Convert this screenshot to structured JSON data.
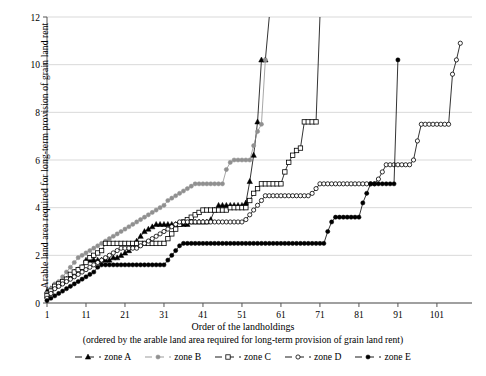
{
  "axes": {
    "ylabel": "Arable land area required for long-term provision of grain land rent",
    "xlabel_line1": "Order of the landholdings",
    "xlabel_line2": "(ordered by the arable land area required for long-term provision of grain land rent)",
    "yticks": [
      "0",
      "2",
      "4",
      "6",
      "8",
      "10",
      "12"
    ],
    "xticks": [
      "1",
      "11",
      "21",
      "31",
      "41",
      "51",
      "61",
      "71",
      "81",
      "91",
      "101"
    ]
  },
  "legend": {
    "items": [
      {
        "label": "zone A",
        "marker": "filled-triangle",
        "color": "#000000"
      },
      {
        "label": "zone B",
        "marker": "filled-circle",
        "color": "#909090"
      },
      {
        "label": "zone C",
        "marker": "open-square",
        "color": "#000000"
      },
      {
        "label": "zone D",
        "marker": "open-circle",
        "color": "#000000"
      },
      {
        "label": "zone E",
        "marker": "filled-circle",
        "color": "#000000"
      }
    ]
  },
  "chart_data": {
    "type": "line",
    "title": "",
    "xlabel": "Order of the landholdings (ordered by the arable land area required for long-term provision of grain land rent)",
    "ylabel": "Arable land area required for long-term provision of grain land rent",
    "xlim": [
      1,
      110
    ],
    "ylim": [
      0,
      12
    ],
    "xticks": [
      1,
      11,
      21,
      31,
      41,
      51,
      61,
      71,
      81,
      91,
      101
    ],
    "yticks": [
      0,
      2,
      4,
      6,
      8,
      10,
      12
    ],
    "grid": "horizontal",
    "legend_position": "bottom",
    "note": "Step (staircase) curves; each series terminates with a vertical rise off the top of the plot.",
    "series": [
      {
        "name": "zone A",
        "marker": "filled-triangle",
        "color": "#000000",
        "x": [
          1,
          2,
          3,
          4,
          5,
          6,
          7,
          8,
          9,
          10,
          11,
          12,
          13,
          14,
          15,
          16,
          17,
          18,
          19,
          20,
          21,
          22,
          23,
          24,
          25,
          26,
          27,
          28,
          29,
          30,
          31,
          32,
          33,
          34,
          35,
          36,
          37,
          38,
          39,
          40,
          41,
          42,
          43,
          44,
          45,
          46,
          47,
          48,
          49,
          50,
          51,
          52,
          53,
          54,
          55,
          56,
          57,
          58
        ],
        "y": [
          0.5,
          0.6,
          0.7,
          0.8,
          0.9,
          1.0,
          1.1,
          1.3,
          1.4,
          1.5,
          1.8,
          1.8,
          1.8,
          1.8,
          1.8,
          1.8,
          1.8,
          1.9,
          1.9,
          2.0,
          2.1,
          2.2,
          2.4,
          2.6,
          2.8,
          3.0,
          3.1,
          3.2,
          3.3,
          3.3,
          3.3,
          3.3,
          3.3,
          3.3,
          3.3,
          3.3,
          3.3,
          3.4,
          3.4,
          3.4,
          3.4,
          3.4,
          3.5,
          3.9,
          4.1,
          4.1,
          4.1,
          4.1,
          4.1,
          4.1,
          4.1,
          4.2,
          5.1,
          6.2,
          7.6,
          10.2,
          10.2,
          12.0
        ]
      },
      {
        "name": "zone B",
        "marker": "filled-circle",
        "color": "#909090",
        "x": [
          1,
          2,
          3,
          4,
          5,
          6,
          7,
          8,
          9,
          10,
          11,
          12,
          13,
          14,
          15,
          16,
          17,
          18,
          19,
          20,
          21,
          22,
          23,
          24,
          25,
          26,
          27,
          28,
          29,
          30,
          31,
          32,
          33,
          34,
          35,
          36,
          37,
          38,
          39,
          40,
          41,
          42,
          43,
          44,
          45,
          46,
          47,
          48,
          49,
          50,
          51,
          52,
          53,
          54,
          55,
          56,
          57
        ],
        "y": [
          0.4,
          0.6,
          0.8,
          0.9,
          1.1,
          1.3,
          1.5,
          1.7,
          1.9,
          2.0,
          2.1,
          2.2,
          2.3,
          2.4,
          2.5,
          2.6,
          2.7,
          2.8,
          2.9,
          3.0,
          3.1,
          3.2,
          3.3,
          3.4,
          3.5,
          3.6,
          3.7,
          3.8,
          3.9,
          4.0,
          4.1,
          4.3,
          4.4,
          4.5,
          4.6,
          4.7,
          4.8,
          4.9,
          5.0,
          5.0,
          5.0,
          5.0,
          5.0,
          5.0,
          5.0,
          5.0,
          5.6,
          5.9,
          6.0,
          6.0,
          6.0,
          6.0,
          6.0,
          6.6,
          7.2,
          7.5,
          10.2
        ]
      },
      {
        "name": "zone C",
        "marker": "open-square",
        "color": "#000000",
        "x": [
          1,
          2,
          3,
          4,
          5,
          6,
          7,
          8,
          9,
          10,
          11,
          12,
          13,
          14,
          15,
          16,
          17,
          18,
          19,
          20,
          21,
          22,
          23,
          24,
          25,
          26,
          27,
          28,
          29,
          30,
          31,
          32,
          33,
          34,
          35,
          36,
          37,
          38,
          39,
          40,
          41,
          42,
          43,
          44,
          45,
          46,
          47,
          48,
          49,
          50,
          51,
          52,
          53,
          54,
          55,
          56,
          57,
          58,
          59,
          60,
          61,
          62,
          63,
          64,
          65,
          66,
          67,
          68,
          69,
          70,
          71
        ],
        "y": [
          0.3,
          0.5,
          0.7,
          0.8,
          0.9,
          1.0,
          1.2,
          1.3,
          1.4,
          1.5,
          1.7,
          1.9,
          2.0,
          2.1,
          2.2,
          2.5,
          2.5,
          2.5,
          2.5,
          2.5,
          2.5,
          2.5,
          2.5,
          2.5,
          2.5,
          2.5,
          2.5,
          2.5,
          2.5,
          2.5,
          2.5,
          2.7,
          2.9,
          3.1,
          3.3,
          3.4,
          3.5,
          3.6,
          3.7,
          3.8,
          3.9,
          3.9,
          3.9,
          3.9,
          3.9,
          3.9,
          3.9,
          4.0,
          4.0,
          4.0,
          4.0,
          4.0,
          4.3,
          4.6,
          4.8,
          5.0,
          5.0,
          5.0,
          5.0,
          5.0,
          5.0,
          5.5,
          5.9,
          6.2,
          6.4,
          6.5,
          7.6,
          7.6,
          7.6,
          7.6,
          12.0
        ]
      },
      {
        "name": "zone D",
        "marker": "open-circle",
        "color": "#000000",
        "x": [
          1,
          2,
          3,
          4,
          5,
          6,
          7,
          8,
          9,
          10,
          11,
          12,
          13,
          14,
          15,
          16,
          17,
          18,
          19,
          20,
          21,
          22,
          23,
          24,
          25,
          26,
          27,
          28,
          29,
          30,
          31,
          32,
          33,
          34,
          35,
          36,
          37,
          38,
          39,
          40,
          41,
          42,
          43,
          44,
          45,
          46,
          47,
          48,
          49,
          50,
          51,
          52,
          53,
          54,
          55,
          56,
          57,
          58,
          59,
          60,
          61,
          62,
          63,
          64,
          65,
          66,
          67,
          68,
          69,
          70,
          71,
          72,
          73,
          74,
          75,
          76,
          77,
          78,
          79,
          80,
          81,
          82,
          83,
          84,
          85,
          86,
          87,
          88,
          89,
          90,
          91,
          92,
          93,
          94,
          95,
          96,
          97,
          98,
          99,
          100,
          101,
          102,
          103,
          104,
          105,
          106,
          107
        ],
        "y": [
          0.2,
          0.4,
          0.6,
          0.7,
          0.8,
          0.9,
          1.0,
          1.1,
          1.2,
          1.3,
          1.4,
          1.5,
          1.6,
          1.7,
          1.8,
          1.9,
          2.0,
          2.1,
          2.2,
          2.3,
          2.3,
          2.3,
          2.3,
          2.3,
          2.4,
          2.5,
          2.6,
          2.7,
          2.8,
          2.9,
          3.0,
          3.1,
          3.2,
          3.3,
          3.4,
          3.4,
          3.4,
          3.4,
          3.4,
          3.4,
          3.4,
          3.4,
          3.4,
          3.4,
          3.4,
          3.4,
          3.4,
          3.4,
          3.4,
          3.4,
          3.4,
          3.5,
          3.7,
          3.9,
          4.1,
          4.3,
          4.5,
          4.5,
          4.5,
          4.5,
          4.5,
          4.5,
          4.5,
          4.5,
          4.5,
          4.5,
          4.5,
          4.5,
          4.6,
          4.8,
          5.0,
          5.0,
          5.0,
          5.0,
          5.0,
          5.0,
          5.0,
          5.0,
          5.0,
          5.0,
          5.0,
          5.0,
          5.0,
          5.0,
          5.0,
          5.2,
          5.5,
          5.8,
          5.8,
          5.8,
          5.8,
          5.8,
          5.8,
          5.8,
          6.0,
          6.8,
          7.5,
          7.5,
          7.5,
          7.5,
          7.5,
          7.5,
          7.5,
          7.5,
          9.6,
          10.2,
          10.9
        ]
      },
      {
        "name": "zone E",
        "marker": "filled-circle",
        "color": "#000000",
        "x": [
          1,
          2,
          3,
          4,
          5,
          6,
          7,
          8,
          9,
          10,
          11,
          12,
          13,
          14,
          15,
          16,
          17,
          18,
          19,
          20,
          21,
          22,
          23,
          24,
          25,
          26,
          27,
          28,
          29,
          30,
          31,
          32,
          33,
          34,
          35,
          36,
          37,
          38,
          39,
          40,
          41,
          42,
          43,
          44,
          45,
          46,
          47,
          48,
          49,
          50,
          51,
          52,
          53,
          54,
          55,
          56,
          57,
          58,
          59,
          60,
          61,
          62,
          63,
          64,
          65,
          66,
          67,
          68,
          69,
          70,
          71,
          72,
          73,
          74,
          75,
          76,
          77,
          78,
          79,
          80,
          81,
          82,
          83,
          84,
          85,
          86,
          87,
          88,
          89,
          90,
          91
        ],
        "y": [
          0.1,
          0.2,
          0.3,
          0.4,
          0.5,
          0.6,
          0.7,
          0.8,
          0.9,
          1.0,
          1.1,
          1.2,
          1.3,
          1.5,
          1.6,
          1.6,
          1.6,
          1.6,
          1.6,
          1.6,
          1.6,
          1.6,
          1.6,
          1.6,
          1.6,
          1.6,
          1.6,
          1.6,
          1.6,
          1.6,
          1.6,
          1.8,
          2.0,
          2.2,
          2.4,
          2.5,
          2.5,
          2.5,
          2.5,
          2.5,
          2.5,
          2.5,
          2.5,
          2.5,
          2.5,
          2.5,
          2.5,
          2.5,
          2.5,
          2.5,
          2.5,
          2.5,
          2.5,
          2.5,
          2.5,
          2.5,
          2.5,
          2.5,
          2.5,
          2.5,
          2.5,
          2.5,
          2.5,
          2.5,
          2.5,
          2.5,
          2.5,
          2.5,
          2.5,
          2.5,
          2.5,
          2.5,
          3.0,
          3.4,
          3.6,
          3.6,
          3.6,
          3.6,
          3.6,
          3.6,
          3.6,
          4.2,
          4.6,
          5.0,
          5.0,
          5.0,
          5.0,
          5.0,
          5.0,
          5.0,
          10.2
        ]
      }
    ]
  }
}
